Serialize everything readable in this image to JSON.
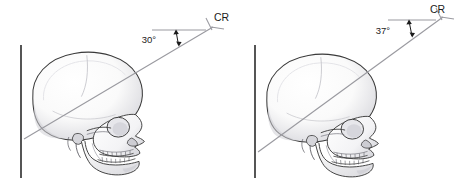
{
  "figure": {
    "kind": "radiographic-positioning-diagram",
    "background_color": "#ffffff",
    "panels": [
      {
        "id": "left",
        "name": "skull-lateral-30-degrees",
        "angle_label": "30°",
        "cr_label": "CR",
        "receptor_line": {
          "x": 21,
          "y_top": 45,
          "y_bottom": 178,
          "color": "#2b2b2b"
        },
        "cr_ray": {
          "x1": 24,
          "y1": 139,
          "x2": 213,
          "y2": 27,
          "color": "#9a9aa0"
        },
        "reference_line": {
          "x1": 152,
          "y1": 30,
          "x2": 206,
          "y2": 30,
          "color": "#9a9aa0"
        },
        "skull": {
          "outline_color": "#3a3a3a",
          "fill_color": "#fbfbfb",
          "shade_color": "#d8d8dc"
        }
      },
      {
        "id": "right",
        "name": "skull-lateral-37-degrees",
        "angle_label": "37°",
        "cr_label": "CR",
        "receptor_line": {
          "x": 255,
          "y_top": 45,
          "y_bottom": 178,
          "color": "#2b2b2b"
        },
        "cr_ray": {
          "x1": 258,
          "y1": 152,
          "x2": 443,
          "y2": 17,
          "color": "#9a9aa0"
        },
        "reference_line": {
          "x1": 388,
          "y1": 20,
          "x2": 436,
          "y2": 20,
          "color": "#9a9aa0"
        },
        "skull": {
          "outline_color": "#3a3a3a",
          "fill_color": "#fbfbfb",
          "shade_color": "#d8d8dc"
        }
      }
    ],
    "colors": {
      "ink": "#1b1b1b",
      "ray": "#9a9aa0",
      "receptor": "#2b2b2b",
      "bone_outline": "#3a3a3a",
      "bone_fill": "#fbfbfb",
      "bone_shade": "#d8d8dc"
    }
  }
}
